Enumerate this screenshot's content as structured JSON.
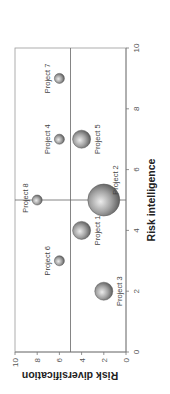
{
  "chart_data": {
    "type": "scatter",
    "subtype": "bubble",
    "title": "",
    "xlabel": "Risk intelligence",
    "ylabel": "Risk diversification",
    "xlim": [
      0,
      10
    ],
    "ylim": [
      0,
      10
    ],
    "xticks": [
      "0",
      "2",
      "4",
      "6",
      "8",
      "10"
    ],
    "yticks": [
      "0",
      "2",
      "4",
      "6",
      "8",
      "10"
    ],
    "grid": false,
    "quadrant_lines": {
      "x": 5,
      "y": 5
    },
    "orientation": "rotated 90° counter-clockwise",
    "points": [
      {
        "name": "Project 1",
        "x": 4,
        "y": 4,
        "size": "medium"
      },
      {
        "name": "Project 2",
        "x": 5,
        "y": 2,
        "size": "large"
      },
      {
        "name": "Project 3",
        "x": 2,
        "y": 2,
        "size": "medium"
      },
      {
        "name": "Project 4",
        "x": 7,
        "y": 6,
        "size": "small"
      },
      {
        "name": "Project 5",
        "x": 7,
        "y": 4,
        "size": "medium"
      },
      {
        "name": "Project 6",
        "x": 3,
        "y": 6,
        "size": "small"
      },
      {
        "name": "Project 7",
        "x": 9,
        "y": 6,
        "size": "small"
      },
      {
        "name": "Project 8",
        "x": 5,
        "y": 8,
        "size": "small"
      }
    ],
    "colors": {
      "bubble_fill": "#8a8a8a",
      "bubble_highlight": "#e6e6e6",
      "axis": "#777777"
    }
  }
}
